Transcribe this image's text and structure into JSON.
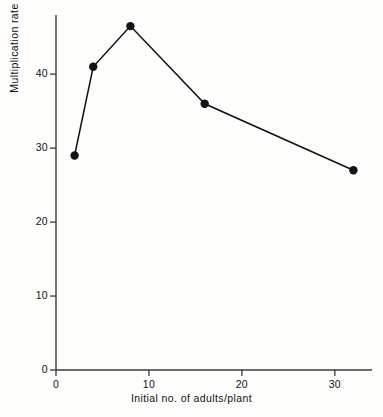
{
  "chart_data": {
    "type": "line",
    "title": "",
    "xlabel": "Initial no. of adults/plant",
    "ylabel": "Multiplication rate",
    "x": [
      2,
      4,
      8,
      16,
      32
    ],
    "values": [
      29,
      41,
      46.5,
      36,
      27
    ],
    "series": [
      {
        "name": "Multiplication rate",
        "x": [
          2,
          4,
          8,
          16,
          32
        ],
        "values": [
          29,
          41,
          46.5,
          36,
          27
        ]
      }
    ],
    "xlim": [
      0,
      34
    ],
    "ylim": [
      0,
      48
    ],
    "xticks": [
      0,
      10,
      20,
      30
    ],
    "xtick_labels": [
      "0",
      "10",
      "20",
      "30"
    ],
    "yticks": [
      0,
      10,
      20,
      30,
      40
    ],
    "ytick_labels": [
      "0",
      "10",
      "20",
      "30",
      "40"
    ],
    "grid": false,
    "legend": false,
    "marker": "filled-circle",
    "line_color": "#121212",
    "marker_color": "#121212",
    "axis_color": "#3a3a3a",
    "background_color": "#fdfdfb"
  }
}
